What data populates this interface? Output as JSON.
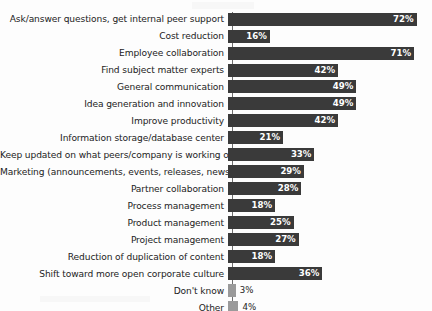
{
  "chart_data": {
    "type": "bar",
    "orientation": "horizontal",
    "title": "",
    "subtitle": "",
    "xlabel": "",
    "ylabel": "",
    "xlim": [
      0,
      80
    ],
    "grid": false,
    "legend": null,
    "value_suffix": "%",
    "categories": [
      "Ask/answer questions, get internal peer support",
      "Cost reduction",
      "Employee collaboration",
      "Find subject matter experts",
      "General communication",
      "Idea generation and innovation",
      "Improve productivity",
      "Information storage/database center",
      "Keep updated on what peers/company is working on",
      "Marketing (announcements, events, releases, news)",
      "Partner collaboration",
      "Process management",
      "Product management",
      "Project management",
      "Reduction of duplication of content",
      "Shift toward more open corporate culture",
      "Don't know",
      "Other"
    ],
    "values": [
      72,
      16,
      71,
      42,
      49,
      49,
      42,
      21,
      33,
      29,
      28,
      18,
      25,
      27,
      18,
      36,
      3,
      4
    ],
    "value_labels": [
      "72%",
      "16%",
      "71%",
      "42%",
      "49%",
      "49%",
      "42%",
      "21%",
      "33%",
      "29%",
      "28%",
      "18%",
      "25%",
      "27%",
      "18%",
      "36%",
      "3%",
      "4%"
    ],
    "bar_styles": [
      "dark",
      "dark",
      "dark",
      "dark",
      "dark",
      "dark",
      "dark",
      "dark",
      "dark",
      "dark",
      "dark",
      "dark",
      "dark",
      "dark",
      "dark",
      "dark",
      "light",
      "light"
    ],
    "colors": {
      "bar_dark": "#3a3a3a",
      "bar_light": "#9a9a9a",
      "label_text": "#1c1c1c",
      "inline_value_text": "#ffffff",
      "axis_line": "#6e6e6e",
      "background": "#fdfdfd"
    }
  }
}
